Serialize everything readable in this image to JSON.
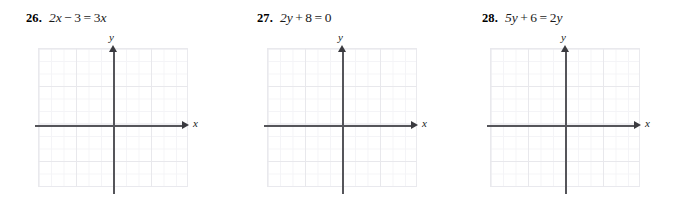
{
  "page": {
    "type": "math-exercise-set",
    "background_color": "#ffffff",
    "grid_minor_color": "#f4f4f7",
    "grid_major_color": "#e8e8ec",
    "axis_color": "#55555a",
    "text_color": "#111111"
  },
  "exercises": [
    {
      "number": "26.",
      "equation": "2x − 3 = 3x",
      "equation_parts": {
        "lhs_coef": "2",
        "lhs_var": "x",
        "lhs_op": "−",
        "lhs_const": "3",
        "equals": "=",
        "rhs_coef": "3",
        "rhs_var": "x"
      },
      "graph": {
        "x_axis_label": "x",
        "y_axis_label": "y",
        "has_x_arrow": true,
        "has_y_arrow": true,
        "grid_columns": 12,
        "grid_rows": 11,
        "plotted_curve": null
      }
    },
    {
      "number": "27.",
      "equation": "2y + 8 = 0",
      "equation_parts": {
        "lhs_coef": "2",
        "lhs_var": "y",
        "lhs_op": "+",
        "lhs_const": "8",
        "equals": "=",
        "rhs_coef": "",
        "rhs_var": "0"
      },
      "graph": {
        "x_axis_label": "x",
        "y_axis_label": "y",
        "has_x_arrow": true,
        "has_y_arrow": true,
        "grid_columns": 12,
        "grid_rows": 11,
        "plotted_curve": null
      }
    },
    {
      "number": "28.",
      "equation": "5y + 6 = 2y",
      "equation_parts": {
        "lhs_coef": "5",
        "lhs_var": "y",
        "lhs_op": "+",
        "lhs_const": "6",
        "equals": "=",
        "rhs_coef": "2",
        "rhs_var": "y"
      },
      "graph": {
        "x_axis_label": "x",
        "y_axis_label": "y",
        "has_x_arrow": true,
        "has_y_arrow": true,
        "grid_columns": 12,
        "grid_rows": 11,
        "plotted_curve": null
      }
    }
  ]
}
